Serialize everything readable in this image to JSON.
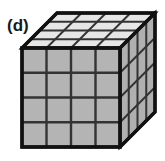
{
  "figure": {
    "panel_label": "(d)",
    "shape": "cube",
    "projection": "oblique",
    "subdivisions_per_edge": 4,
    "total_unit_cubes": 64,
    "visible_faces": [
      "top",
      "front",
      "right"
    ],
    "cells_per_visible_face": 16,
    "colors": {
      "background": "#ffffff",
      "outline": "#111111",
      "grid_line": "#333333",
      "front_face_fill": "#b4b4b4",
      "right_face_fill": "#b0b0b0",
      "top_face_fill": "#e6e6e6",
      "label_color": "#1a1a1a"
    },
    "geometry": {
      "front_left_x": 22,
      "front_right_x": 120,
      "front_top_y": 48,
      "front_bottom_y": 147,
      "depth_dx": 35,
      "depth_dy": -35
    }
  }
}
